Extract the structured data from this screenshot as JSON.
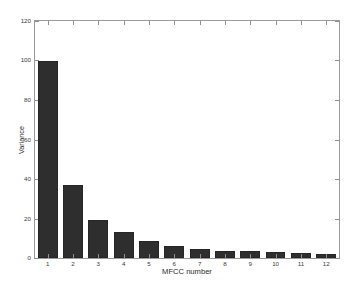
{
  "chart_data": {
    "type": "bar",
    "title": "",
    "xlabel": "MFCC number",
    "ylabel": "Variance",
    "categories": [
      "1",
      "2",
      "3",
      "4",
      "5",
      "6",
      "7",
      "8",
      "9",
      "10",
      "11",
      "12"
    ],
    "values": [
      100,
      37,
      19,
      13,
      8.5,
      6,
      4.5,
      3.8,
      3.4,
      3.1,
      2.5,
      2.2
    ],
    "xlim": [
      0.4,
      12.6
    ],
    "ylim": [
      0,
      120
    ],
    "yticks": [
      0,
      20,
      40,
      60,
      80,
      100,
      120
    ],
    "ytick_labels": [
      "0",
      "20",
      "40",
      "60",
      "80",
      "100",
      "120"
    ],
    "xticks": [
      1,
      2,
      3,
      4,
      5,
      6,
      7,
      8,
      9,
      10,
      11,
      12
    ],
    "grid": false,
    "legend": false,
    "bar_color": "#2e2e2e",
    "bar_edge_color": "#262626",
    "axes_color": "#9a9a9a",
    "background_color": "#ffffff"
  }
}
